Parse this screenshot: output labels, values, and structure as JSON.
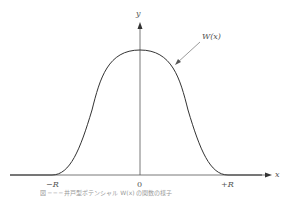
{
  "diagram": {
    "curve_label": "W(x)",
    "x_axis_label": "x",
    "y_axis_label": "y",
    "x_ticks": [
      "−R",
      "0",
      "+R"
    ],
    "caption": "図 ─ ─ ─ 井戸型ポテンシャル W(x) の関数の様子",
    "colors": {
      "curve": "#333333",
      "axis": "#555555",
      "background": "#ffffff"
    }
  }
}
